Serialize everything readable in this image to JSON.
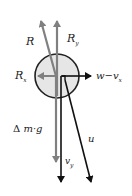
{
  "diagram": {
    "type": "force-vector-diagram",
    "colors": {
      "background": "#ffffff",
      "circle_fill": "#e6e6e6",
      "circle_stroke": "#222222",
      "gray_vector": "#808080",
      "black_vector": "#111111"
    },
    "body": {
      "shape": "circle",
      "cx": 57,
      "cy": 76,
      "r": 22
    },
    "vectors": [
      {
        "id": "R",
        "color": "gray",
        "from": [
          57,
          80
        ],
        "to": [
          41,
          20
        ]
      },
      {
        "id": "Ry",
        "color": "gray",
        "from": [
          57,
          96
        ],
        "to": [
          57,
          20
        ]
      },
      {
        "id": "Rx",
        "color": "gray",
        "from": [
          57,
          76
        ],
        "to": [
          36,
          76
        ]
      },
      {
        "id": "w_minus_vx",
        "color": "black",
        "from": [
          62,
          76
        ],
        "to": [
          93,
          76
        ]
      },
      {
        "id": "delta_m_g",
        "color": "gray",
        "from": [
          56,
          76
        ],
        "to": [
          56,
          164
        ]
      },
      {
        "id": "vy",
        "color": "black",
        "from": [
          61,
          76
        ],
        "to": [
          61,
          184
        ]
      },
      {
        "id": "u",
        "color": "black",
        "from": [
          63,
          77
        ],
        "to": [
          91,
          184
        ]
      }
    ],
    "labels": {
      "R": "R",
      "Ry_main": "R",
      "Ry_sub": "y",
      "Rx_main": "R",
      "Rx_sub": "x",
      "w_minus_vx_main": "w−v",
      "w_minus_vx_sub": "x",
      "delta": "Δ",
      "mg": "m·g",
      "vy_main": "v",
      "vy_sub": "y",
      "u": "u"
    }
  }
}
